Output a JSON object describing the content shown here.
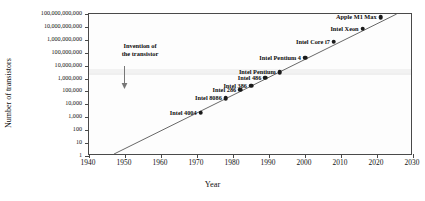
{
  "chart_data": {
    "type": "scatter",
    "title": "",
    "xlabel": "Year",
    "ylabel": "Number of transistors",
    "xlim": [
      1940,
      2030
    ],
    "ylim": [
      1,
      100000000000
    ],
    "yscale": "log",
    "grid": false,
    "legend": null,
    "xticks": [
      "1940",
      "1950",
      "1960",
      "1970",
      "1980",
      "1990",
      "2000",
      "2010",
      "2020",
      "2030"
    ],
    "xtick_values": [
      1940,
      1950,
      1960,
      1970,
      1980,
      1990,
      2000,
      2010,
      2020,
      2030
    ],
    "yticks": [
      "1",
      "10",
      "100",
      "1,000",
      "10,000",
      "100,000",
      "1,000,000",
      "10,000,000",
      "100,000,000",
      "1,000,000,000",
      "10,000,000,000",
      "100,000,000,000"
    ],
    "ytick_values": [
      1,
      10,
      100,
      1000,
      10000,
      100000,
      1000000,
      10000000,
      100000000,
      1000000000,
      10000000000,
      100000000000
    ],
    "points": [
      {
        "label": "Intel 4004",
        "x": 1971,
        "y": 2300,
        "label_pos": "left"
      },
      {
        "label": "Intel 8086",
        "x": 1978,
        "y": 29000,
        "label_pos": "left"
      },
      {
        "label": "Intel 286",
        "x": 1982,
        "y": 134000,
        "label_pos": "left"
      },
      {
        "label": "Intel 386",
        "x": 1985,
        "y": 275000,
        "label_pos": "left"
      },
      {
        "label": "Intel 486",
        "x": 1989,
        "y": 1200000,
        "label_pos": "left"
      },
      {
        "label": "Intel Pentium",
        "x": 1993,
        "y": 3100000,
        "label_pos": "left"
      },
      {
        "label": "Intel Pentium 4",
        "x": 2000,
        "y": 42000000,
        "label_pos": "left"
      },
      {
        "label": "Intel Core i7",
        "x": 2008,
        "y": 731000000,
        "label_pos": "left"
      },
      {
        "label": "Intel Xeon",
        "x": 2016,
        "y": 7200000000,
        "label_pos": "left"
      },
      {
        "label": "Apple M1 Max",
        "x": 2021,
        "y": 57000000000,
        "label_pos": "left"
      }
    ],
    "trendline": {
      "x_start": 1947,
      "y_start": 1,
      "x_end": 2026,
      "y_end": 100000000000
    },
    "annotations": [
      {
        "text_line1": "Invention of",
        "text_line2": "the transistor",
        "x": 1947,
        "arrow": "down"
      }
    ],
    "colors": {
      "marker": "#1a1a1a",
      "line": "#555555",
      "axis": "#4a4a4a",
      "text": "#111111"
    }
  }
}
